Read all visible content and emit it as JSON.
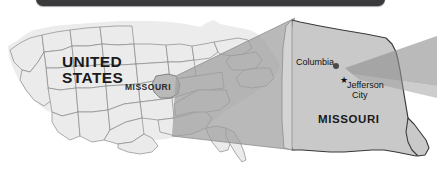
{
  "image": {
    "kind": "map-figure",
    "width": 437,
    "height": 173,
    "background": "#ffffff"
  },
  "topbar": {
    "name": "dark-rounded-bar",
    "label": "",
    "color": "#3a3a3c"
  },
  "palette": {
    "state_fill": "#ebebeb",
    "state_stroke": "#7a7a7a",
    "highlight_fill": "#9a9a9a",
    "cone_fill": "#9e9e9e",
    "detail_fill": "#c9c9c9",
    "detail_stroke": "#3a3a3a",
    "text": "#1a1a1a"
  },
  "overview_map": {
    "name": "united-states-overview-map",
    "country_label_line1": "UNITED",
    "country_label_line2": "STATES",
    "highlighted_state_label": "MISSOURI"
  },
  "detail_map": {
    "name": "missouri-detail-map",
    "state_label": "MISSOURI",
    "cities": [
      {
        "name": "Columbia",
        "label": "Columbia",
        "marker": "dot-marker",
        "marker_glyph": "●"
      },
      {
        "name": "Jefferson City",
        "label_line1": "Jefferson",
        "label_line2": "City",
        "marker": "star-marker",
        "marker_glyph": "★"
      }
    ]
  },
  "cones": {
    "primary": "magnifier-cone-to-detail",
    "secondary": "magnifier-cone-exit-right"
  }
}
